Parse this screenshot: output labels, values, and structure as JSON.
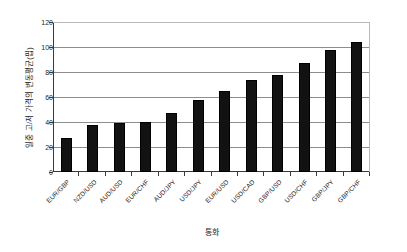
{
  "chart_data": {
    "type": "bar",
    "title": "",
    "subtitle": "",
    "xlabel": "통화",
    "ylabel": "일중 고/저 가격의 변동평균(핍)",
    "categories": [
      "EUR/GBP",
      "NZD/USD",
      "AUD/USD",
      "EUR/CHF",
      "AUD/JPY",
      "USD/JPY",
      "EUR/USD",
      "USD/CAD",
      "GBP/USD",
      "USD/CHF",
      "GBP/JPY",
      "GBP/CHF"
    ],
    "values": [
      27,
      38,
      39,
      40,
      47,
      58,
      65,
      74,
      78,
      87,
      98,
      104
    ],
    "ylim": [
      0,
      120
    ],
    "yticks": [
      0,
      20,
      40,
      60,
      80,
      100,
      120
    ],
    "ytick_labels": [
      "0",
      "20",
      "40",
      "60",
      "80",
      "100",
      "120"
    ],
    "grid": true,
    "grid_axis": "y",
    "legend": false,
    "legend_position": "none",
    "bar_color": "#121212",
    "background_color": "#ffffff",
    "axis_color": "#3a3a3a",
    "gridline_color": "#8d8d8d",
    "xtick_rotation": -45
  }
}
